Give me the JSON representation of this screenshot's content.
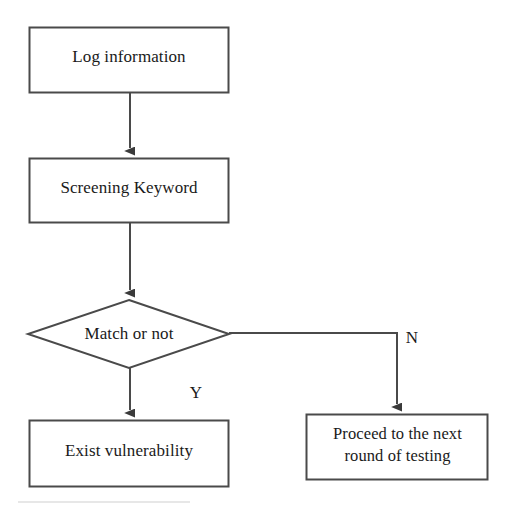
{
  "diagram": {
    "type": "flowchart",
    "background_color": "#ffffff",
    "stroke_color": "#4a4a4a",
    "text_color": "#1a1a1a",
    "nodes": [
      {
        "id": "log-information",
        "shape": "rectangle",
        "label": "Log information",
        "x": 29,
        "y": 27,
        "width": 200,
        "height": 66
      },
      {
        "id": "screening-keyword",
        "shape": "rectangle",
        "label": "Screening Keyword",
        "x": 29,
        "y": 158,
        "width": 200,
        "height": 65
      },
      {
        "id": "match-or-not",
        "shape": "diamond",
        "label": "Match or not",
        "x": 28,
        "y": 300,
        "width": 201,
        "height": 68
      },
      {
        "id": "exist-vulnerability",
        "shape": "rectangle",
        "label": "Exist vulnerability",
        "x": 29,
        "y": 420,
        "width": 200,
        "height": 67
      },
      {
        "id": "proceed-next-round",
        "shape": "rectangle",
        "label": "Proceed to the next\nround of testing",
        "x": 306,
        "y": 414,
        "width": 182,
        "height": 66
      }
    ],
    "edges": [
      {
        "id": "edge-log-to-screening",
        "from": "log-information",
        "to": "screening-keyword",
        "label": "",
        "arrow": true
      },
      {
        "id": "edge-screening-to-match",
        "from": "screening-keyword",
        "to": "match-or-not",
        "label": "",
        "arrow": true
      },
      {
        "id": "edge-match-yes",
        "from": "match-or-not",
        "to": "exist-vulnerability",
        "label": "Y",
        "arrow": true
      },
      {
        "id": "edge-match-no",
        "from": "match-or-not",
        "to": "proceed-next-round",
        "label": "N",
        "arrow": true
      }
    ],
    "edge_labels": {
      "yes": "Y",
      "no": "N"
    }
  }
}
